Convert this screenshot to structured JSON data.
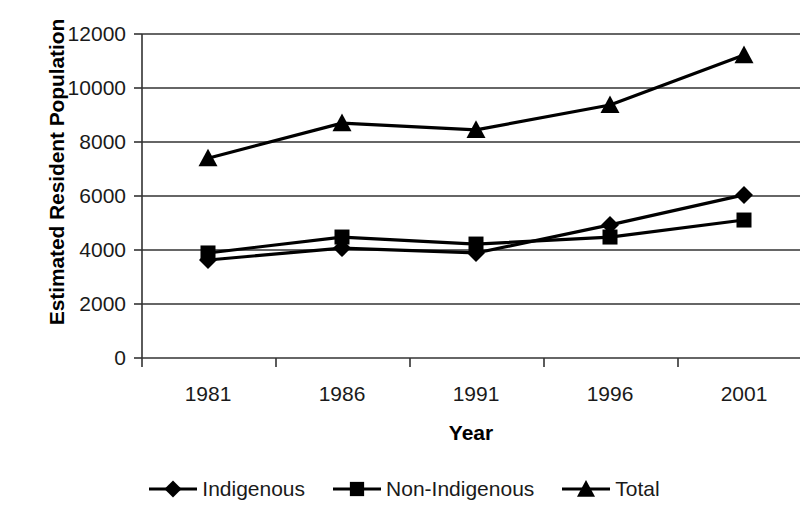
{
  "chart_data": {
    "type": "line",
    "title": "",
    "xlabel": "Year",
    "ylabel": "Estimated Resident Population",
    "categories": [
      "1981",
      "1986",
      "1991",
      "1996",
      "2001"
    ],
    "x": [
      1981,
      1986,
      1991,
      1996,
      2001
    ],
    "ylim": [
      0,
      12000
    ],
    "ytick_labels": [
      "12000",
      "10000",
      "8000",
      "6000",
      "4000",
      "2000",
      "0"
    ],
    "yticks": [
      12000,
      10000,
      8000,
      6000,
      4000,
      2000,
      0
    ],
    "grid": true,
    "legend_position": "bottom",
    "series": [
      {
        "name": "Indigenous",
        "marker": "diamond",
        "color": "#000000",
        "values": [
          3630,
          4070,
          3890,
          4930,
          6040
        ]
      },
      {
        "name": "Non-Indigenous",
        "marker": "square",
        "color": "#000000",
        "values": [
          3890,
          4480,
          4220,
          4480,
          5110
        ]
      },
      {
        "name": "Total",
        "marker": "triangle",
        "color": "#000000",
        "values": [
          7400,
          8700,
          8450,
          9370,
          11220
        ]
      }
    ]
  },
  "axis": {
    "y_title": "Estimated Resident Population",
    "x_title": "Year"
  },
  "legend": {
    "items": [
      {
        "label": "Indigenous",
        "marker": "diamond-marker-icon"
      },
      {
        "label": "Non-Indigenous",
        "marker": "square-marker-icon"
      },
      {
        "label": "Total",
        "marker": "triangle-marker-icon"
      }
    ]
  },
  "colors": {
    "series": "#000000",
    "grid": "#333333",
    "axis": "#333333",
    "text": "#1a1a1a",
    "background": "#ffffff"
  }
}
